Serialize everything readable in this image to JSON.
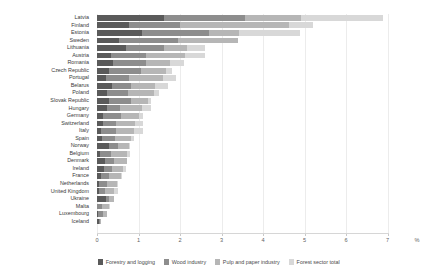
{
  "chart_data": {
    "type": "bar",
    "orientation": "horizontal",
    "stacked": true,
    "title": "",
    "subtitle": "",
    "xlabel": "%",
    "ylabel": "",
    "xlim": [
      0,
      7
    ],
    "xticks": [
      0,
      1,
      2,
      3,
      4,
      5,
      6,
      7
    ],
    "xticklabels": [
      "0",
      "1",
      "2",
      "3",
      "4",
      "5",
      "6",
      "7"
    ],
    "grid": true,
    "grid_axis": "x",
    "legend_position": "bottom",
    "categories": [
      "Latvia",
      "Finland",
      "Estonia",
      "Sweden",
      "Lithuania",
      "Austria",
      "Romania",
      "Czech Republic",
      "Portugal",
      "Belarus",
      "Poland",
      "Slovak Republic",
      "Hungary",
      "Germany",
      "Switzerland",
      "Italy",
      "Spain",
      "Norway",
      "Belgium",
      "Denmark",
      "Ireland",
      "France",
      "Netherlands",
      "United Kingdom",
      "Ukraine",
      "Malta",
      "Luxembourg",
      "Iceland"
    ],
    "series": [
      {
        "name": "Forestry and logging",
        "color": "#5a5a5a",
        "values": [
          1.62,
          0.76,
          1.09,
          0.52,
          0.71,
          0.33,
          0.38,
          0.3,
          0.22,
          0.36,
          0.25,
          0.29,
          0.23,
          0.15,
          0.14,
          0.1,
          0.13,
          0.3,
          0.07,
          0.19,
          0.16,
          0.1,
          0.06,
          0.05,
          0.21,
          0.01,
          0.03,
          0.04
        ]
      },
      {
        "name": "Wood industry",
        "color": "#8d8d8d",
        "values": [
          1.95,
          1.24,
          1.61,
          1.42,
          0.9,
          0.85,
          0.79,
          0.75,
          0.56,
          0.46,
          0.5,
          0.53,
          0.33,
          0.42,
          0.31,
          0.36,
          0.3,
          0.21,
          0.27,
          0.22,
          0.2,
          0.2,
          0.17,
          0.14,
          0.09,
          0.12,
          0.11,
          0.04
        ]
      },
      {
        "name": "Pulp and paper industry",
        "color": "#b6b6b6",
        "values": [
          1.35,
          2.62,
          0.71,
          1.46,
          0.57,
          0.95,
          0.6,
          0.62,
          0.81,
          0.58,
          0.62,
          0.4,
          0.52,
          0.44,
          0.47,
          0.42,
          0.38,
          0.25,
          0.39,
          0.31,
          0.27,
          0.28,
          0.26,
          0.22,
          0.11,
          0.15,
          0.1,
          0.02
        ]
      },
      {
        "name": "Forest sector total",
        "color": "#d8d8d8",
        "values": [
          1.98,
          0.58,
          1.49,
          0.0,
          0.42,
          0.47,
          0.33,
          0.13,
          0.31,
          0.3,
          0.13,
          0.08,
          0.22,
          0.09,
          0.18,
          0.22,
          0.09,
          0.04,
          0.07,
          0.0,
          0.07,
          0.02,
          0.01,
          0.09,
          0.0,
          0.02,
          0.0,
          0.0
        ]
      }
    ],
    "totals": [
      6.9,
      5.2,
      4.9,
      3.4,
      2.6,
      2.6,
      2.1,
      1.8,
      1.9,
      1.7,
      1.5,
      1.3,
      1.3,
      1.1,
      1.1,
      1.1,
      0.9,
      0.8,
      0.8,
      0.72,
      0.7,
      0.6,
      0.5,
      0.5,
      0.41,
      0.3,
      0.24,
      0.1
    ]
  },
  "axis": {
    "unit_label": "%"
  },
  "legend": {
    "items": [
      {
        "label": "Forestry and logging",
        "color": "#5a5a5a"
      },
      {
        "label": "Wood industry",
        "color": "#8d8d8d"
      },
      {
        "label": "Pulp and paper industry",
        "color": "#b6b6b6"
      },
      {
        "label": "Forest sector total",
        "color": "#d8d8d8"
      }
    ]
  }
}
